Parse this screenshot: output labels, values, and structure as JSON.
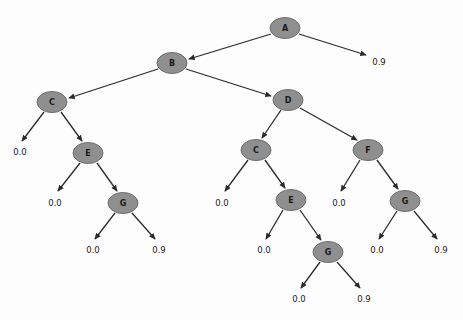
{
  "diagram": {
    "type": "decision-tree",
    "title": "",
    "node_fill_color": "#8f8f8f",
    "node_stroke_color": "#6f6f6f",
    "edge_color": "#2b2b2b",
    "background_color": "#fdfdfd",
    "nodes": [
      {
        "id": "n_A",
        "label": "A",
        "x": 285,
        "y": 28,
        "rx": 15,
        "ry": 10.5
      },
      {
        "id": "n_B",
        "label": "B",
        "x": 172,
        "y": 63,
        "rx": 15,
        "ry": 10.5
      },
      {
        "id": "n_C_L",
        "label": "C",
        "x": 52,
        "y": 102,
        "rx": 15,
        "ry": 10.5
      },
      {
        "id": "n_D",
        "label": "D",
        "x": 288,
        "y": 100,
        "rx": 15,
        "ry": 10.5
      },
      {
        "id": "n_E_L",
        "label": "E",
        "x": 88,
        "y": 153,
        "rx": 15,
        "ry": 10.5
      },
      {
        "id": "n_C_R",
        "label": "C",
        "x": 256,
        "y": 150,
        "rx": 15,
        "ry": 10.5
      },
      {
        "id": "n_F",
        "label": "F",
        "x": 368,
        "y": 150,
        "rx": 15,
        "ry": 10.5
      },
      {
        "id": "n_G_L",
        "label": "G",
        "x": 123,
        "y": 203,
        "rx": 15,
        "ry": 10.5
      },
      {
        "id": "n_E_R",
        "label": "E",
        "x": 291,
        "y": 200,
        "rx": 15,
        "ry": 10.5
      },
      {
        "id": "n_G_F",
        "label": "G",
        "x": 405,
        "y": 201,
        "rx": 15,
        "ry": 10.5
      },
      {
        "id": "n_G_R",
        "label": "G",
        "x": 328,
        "y": 252,
        "rx": 15,
        "ry": 10.5
      }
    ],
    "leaves": [
      {
        "id": "l_A_right",
        "value": "0.9",
        "x": 379,
        "y": 62
      },
      {
        "id": "l_CL_left",
        "value": "0.0",
        "x": 20,
        "y": 152
      },
      {
        "id": "l_EL_left",
        "value": "0.0",
        "x": 55,
        "y": 203
      },
      {
        "id": "l_GL_left",
        "value": "0.0",
        "x": 93,
        "y": 250
      },
      {
        "id": "l_GL_right",
        "value": "0.9",
        "x": 159,
        "y": 250
      },
      {
        "id": "l_CR_left",
        "value": "0.0",
        "x": 222,
        "y": 203
      },
      {
        "id": "l_F_left",
        "value": "0.0",
        "x": 339,
        "y": 203
      },
      {
        "id": "l_ER_left",
        "value": "0.0",
        "x": 264,
        "y": 250
      },
      {
        "id": "l_GF_left",
        "value": "0.0",
        "x": 377,
        "y": 250
      },
      {
        "id": "l_GF_right",
        "value": "0.9",
        "x": 441,
        "y": 250
      },
      {
        "id": "l_GR_left",
        "value": "0.0",
        "x": 299,
        "y": 299
      },
      {
        "id": "l_GR_right",
        "value": "0.9",
        "x": 364,
        "y": 299
      }
    ],
    "edges": [
      {
        "id": "e_A_B",
        "from": "n_A",
        "to": "n_B",
        "from_x": 271,
        "from_y": 34,
        "to_x": 189,
        "to_y": 59
      },
      {
        "id": "e_A_leaf",
        "from": "n_A",
        "to": "l_A_right",
        "from_x": 299,
        "from_y": 34,
        "to_x": 366,
        "to_y": 55
      },
      {
        "id": "e_B_C",
        "from": "n_B",
        "to": "n_C_L",
        "from_x": 158,
        "from_y": 69,
        "to_x": 69,
        "to_y": 98
      },
      {
        "id": "e_B_D",
        "from": "n_B",
        "to": "n_D",
        "from_x": 186,
        "from_y": 69,
        "to_x": 271,
        "to_y": 96
      },
      {
        "id": "e_CL_leaf",
        "from": "n_C_L",
        "to": "l_CL_left",
        "from_x": 44,
        "from_y": 112,
        "to_x": 22,
        "to_y": 141
      },
      {
        "id": "e_CL_EL",
        "from": "n_C_L",
        "to": "n_E_L",
        "from_x": 61,
        "from_y": 112,
        "to_x": 82,
        "to_y": 141
      },
      {
        "id": "e_D_CR",
        "from": "n_D",
        "to": "n_C_R",
        "from_x": 281,
        "from_y": 110,
        "to_x": 262,
        "to_y": 138
      },
      {
        "id": "e_D_F",
        "from": "n_D",
        "to": "n_F",
        "from_x": 300,
        "from_y": 108,
        "to_x": 357,
        "to_y": 140
      },
      {
        "id": "e_EL_leaf",
        "from": "n_E_L",
        "to": "l_EL_left",
        "from_x": 80,
        "from_y": 163,
        "to_x": 58,
        "to_y": 191
      },
      {
        "id": "e_EL_GL",
        "from": "n_E_L",
        "to": "n_G_L",
        "from_x": 97,
        "from_y": 163,
        "to_x": 117,
        "to_y": 191
      },
      {
        "id": "e_CR_leaf",
        "from": "n_C_R",
        "to": "l_CR_left",
        "from_x": 248,
        "from_y": 160,
        "to_x": 225,
        "to_y": 191
      },
      {
        "id": "e_CR_ER",
        "from": "n_C_R",
        "to": "n_E_R",
        "from_x": 265,
        "from_y": 160,
        "to_x": 285,
        "to_y": 188
      },
      {
        "id": "e_F_leaf",
        "from": "n_F",
        "to": "l_F_left",
        "from_x": 360,
        "from_y": 160,
        "to_x": 341,
        "to_y": 191
      },
      {
        "id": "e_F_GF",
        "from": "n_F",
        "to": "n_G_F",
        "from_x": 377,
        "from_y": 160,
        "to_x": 398,
        "to_y": 189
      },
      {
        "id": "e_GL_left",
        "from": "n_G_L",
        "to": "l_GL_left",
        "from_x": 115,
        "from_y": 213,
        "to_x": 95,
        "to_y": 239
      },
      {
        "id": "e_GL_right",
        "from": "n_G_L",
        "to": "l_GL_right",
        "from_x": 132,
        "from_y": 213,
        "to_x": 155,
        "to_y": 239
      },
      {
        "id": "e_ER_leaf",
        "from": "n_E_R",
        "to": "l_ER_left",
        "from_x": 283,
        "from_y": 210,
        "to_x": 266,
        "to_y": 239
      },
      {
        "id": "e_ER_GR",
        "from": "n_E_R",
        "to": "n_G_R",
        "from_x": 300,
        "from_y": 210,
        "to_x": 321,
        "to_y": 240
      },
      {
        "id": "e_GF_left",
        "from": "n_G_F",
        "to": "l_GF_left",
        "from_x": 397,
        "from_y": 211,
        "to_x": 379,
        "to_y": 239
      },
      {
        "id": "e_GF_right",
        "from": "n_G_F",
        "to": "l_GF_right",
        "from_x": 414,
        "from_y": 211,
        "to_x": 437,
        "to_y": 239
      },
      {
        "id": "e_GR_left",
        "from": "n_G_R",
        "to": "l_GR_left",
        "from_x": 320,
        "from_y": 262,
        "to_x": 301,
        "to_y": 288
      },
      {
        "id": "e_GR_right",
        "from": "n_G_R",
        "to": "l_GR_right",
        "from_x": 337,
        "from_y": 262,
        "to_x": 360,
        "to_y": 288
      }
    ]
  }
}
